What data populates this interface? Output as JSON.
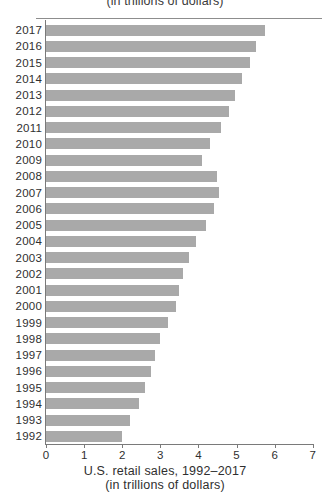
{
  "top_title_partial": "(in trillions of dollars)",
  "caption": {
    "line1": "U.S. retail sales, 1992–2017",
    "line2": "(in trillions of dollars)"
  },
  "colors": {
    "bar": "#a9a9a9",
    "axis": "#7a7a7a",
    "text": "#2f2f2f",
    "background": "#ffffff"
  },
  "chart_data": {
    "type": "bar",
    "orientation": "horizontal",
    "title": "U.S. retail sales, 1992–2017",
    "subtitle": "(in trillions of dollars)",
    "xlabel": "",
    "ylabel": "",
    "xlim": [
      0,
      7
    ],
    "xticks": [
      0,
      1,
      2,
      3,
      4,
      5,
      6,
      7
    ],
    "xtick_labels": [
      "0",
      "1",
      "2",
      "3",
      "4",
      "5",
      "6",
      "7"
    ],
    "grid": false,
    "legend": false,
    "categories": [
      "2017",
      "2016",
      "2015",
      "2014",
      "2013",
      "2012",
      "2011",
      "2010",
      "2009",
      "2008",
      "2007",
      "2006",
      "2005",
      "2004",
      "2003",
      "2002",
      "2001",
      "2000",
      "1999",
      "1998",
      "1997",
      "1996",
      "1995",
      "1994",
      "1993",
      "1992"
    ],
    "values": [
      5.75,
      5.5,
      5.35,
      5.15,
      4.95,
      4.8,
      4.6,
      4.3,
      4.1,
      4.5,
      4.55,
      4.4,
      4.2,
      3.95,
      3.75,
      3.6,
      3.5,
      3.4,
      3.2,
      3.0,
      2.85,
      2.75,
      2.6,
      2.45,
      2.2,
      2.0
    ]
  }
}
